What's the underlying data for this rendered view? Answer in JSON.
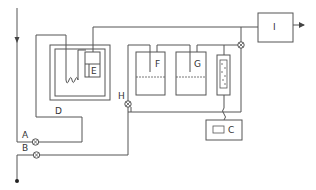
{
  "labels": {
    "A": "A",
    "B": "B",
    "C": "C",
    "D": "D",
    "E": "E",
    "F": "F",
    "G": "G",
    "H": "H",
    "I": "I"
  },
  "colors": {
    "line": "#555555",
    "background": "#ffffff"
  }
}
